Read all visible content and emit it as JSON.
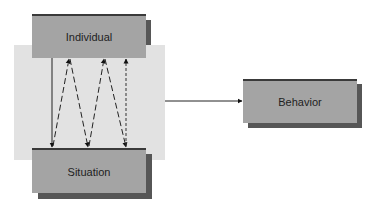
{
  "diagram": {
    "nodes": {
      "individual": "Individual",
      "situation": "Situation",
      "behavior": "Behavior"
    },
    "edges": [
      {
        "from": "individual",
        "to": "situation",
        "style": "solid"
      },
      {
        "from": "situation",
        "to": "individual",
        "style": "dashed"
      },
      {
        "from": "individual",
        "to": "situation",
        "style": "dashed"
      },
      {
        "from": "situation",
        "to": "individual",
        "style": "dashed"
      },
      {
        "from": "individual",
        "to": "situation",
        "style": "dashed"
      },
      {
        "from": "situation",
        "to": "individual",
        "style": "dotted"
      },
      {
        "from": "interaction",
        "to": "behavior",
        "style": "solid"
      }
    ]
  }
}
